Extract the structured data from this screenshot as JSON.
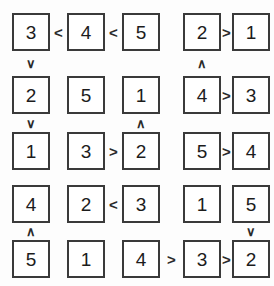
{
  "puzzle": {
    "type": "futoshiki",
    "title": "Futoshiki 5x5 grid",
    "size": 5,
    "colors": {
      "background": "#fdfdfd",
      "cell_background": "#ffffff",
      "cell_border": "#3a3a3a",
      "digit": "#1c1c1c",
      "sign": "#2a2a2a"
    },
    "grid": [
      [
        "3",
        "4",
        "5",
        "2",
        "1"
      ],
      [
        "2",
        "5",
        "1",
        "4",
        "3"
      ],
      [
        "1",
        "3",
        "2",
        "5",
        "4"
      ],
      [
        "4",
        "2",
        "3",
        "1",
        "5"
      ],
      [
        "5",
        "1",
        "4",
        "3",
        "2"
      ]
    ],
    "horizontal_signs": [
      {
        "row": 0,
        "col": 0,
        "sign": "<",
        "name": "h-ineq-r1c1-c2"
      },
      {
        "row": 0,
        "col": 1,
        "sign": "<",
        "name": "h-ineq-r1c2-c3"
      },
      {
        "row": 0,
        "col": 3,
        "sign": ">",
        "name": "h-ineq-r1c4-c5"
      },
      {
        "row": 1,
        "col": 3,
        "sign": ">",
        "name": "h-ineq-r2c4-c5"
      },
      {
        "row": 2,
        "col": 1,
        "sign": ">",
        "name": "h-ineq-r3c2-c3"
      },
      {
        "row": 2,
        "col": 3,
        "sign": ">",
        "name": "h-ineq-r3c4-c5"
      },
      {
        "row": 3,
        "col": 1,
        "sign": "<",
        "name": "h-ineq-r4c2-c3"
      },
      {
        "row": 4,
        "col": 2,
        "sign": ">",
        "name": "h-ineq-r5c3-c4"
      },
      {
        "row": 4,
        "col": 3,
        "sign": ">",
        "name": "h-ineq-r5c4-c5"
      }
    ],
    "vertical_signs": [
      {
        "row": 0,
        "col": 0,
        "sign": "∨",
        "name": "v-ineq-c1r1-r2"
      },
      {
        "row": 1,
        "col": 0,
        "sign": "∨",
        "name": "v-ineq-c1r2-r3"
      },
      {
        "row": 3,
        "col": 0,
        "sign": "∧",
        "name": "v-ineq-c1r4-r5"
      },
      {
        "row": 1,
        "col": 2,
        "sign": "∧",
        "name": "v-ineq-c3r2-r3"
      },
      {
        "row": 0,
        "col": 3,
        "sign": "∧",
        "name": "v-ineq-c4r1-r2"
      },
      {
        "row": 3,
        "col": 4,
        "sign": "∨",
        "name": "v-ineq-c5r4-r5"
      }
    ]
  }
}
